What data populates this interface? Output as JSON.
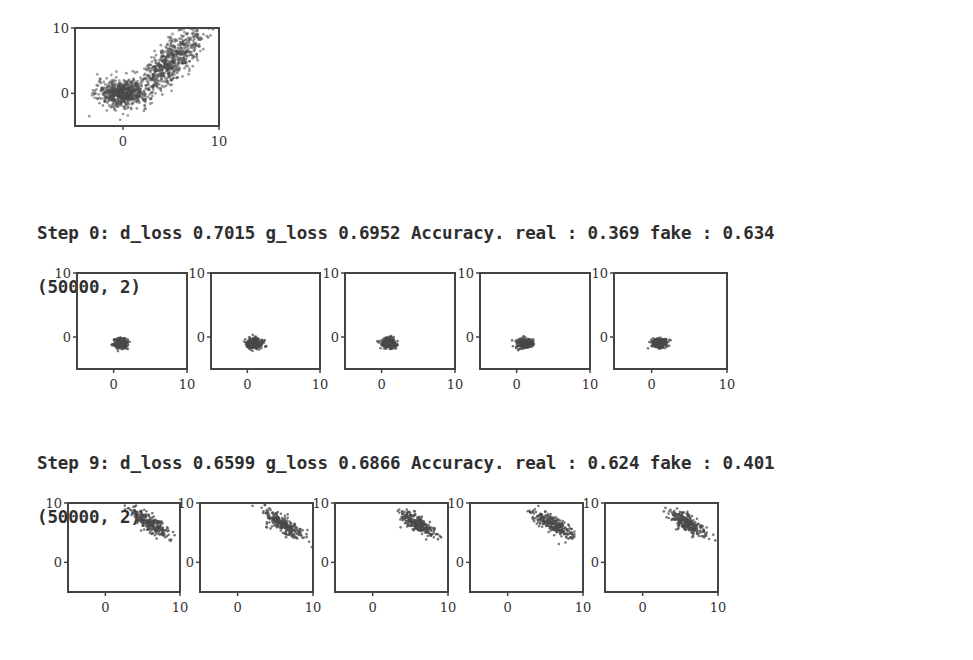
{
  "output": {
    "blocks": [
      {
        "step_line": "Step 0: d_loss 0.7015 g_loss 0.6952 Accuracy. real : 0.369 fake : 0.634",
        "shape_line": "(50000, 2)"
      },
      {
        "step_line": "Step 9: d_loss 0.6599 g_loss 0.6866 Accuracy. real : 0.624 fake : 0.401",
        "shape_line": "(50000, 2)"
      }
    ]
  },
  "chart_data": [
    {
      "type": "scatter",
      "title": "Real data distribution",
      "xlim": [
        -5,
        10
      ],
      "ylim": [
        -5,
        10
      ],
      "xticks": [
        "0",
        "10"
      ],
      "yticks": [
        "0",
        "10"
      ],
      "grid": false,
      "clusters": [
        {
          "name": "blob-1",
          "center": [
            0,
            0
          ],
          "spread": [
            1.3,
            1.0
          ],
          "angle": 0
        },
        {
          "name": "blob-2",
          "center": [
            5,
            5
          ],
          "spread": [
            0.9,
            3.0
          ],
          "angle": -30
        }
      ]
    },
    {
      "type": "scatter",
      "title": "Step 0 generated samples",
      "xlim": [
        -5,
        10
      ],
      "ylim": [
        -5,
        10
      ],
      "xticks": [
        "0",
        "10"
      ],
      "yticks": [
        "0",
        "10"
      ],
      "panels": [
        {
          "center": [
            1,
            -1
          ],
          "spread": [
            0.5,
            0.4
          ],
          "angle": 0
        },
        {
          "center": [
            1,
            -1
          ],
          "spread": [
            0.55,
            0.4
          ],
          "angle": 0
        },
        {
          "center": [
            1,
            -1
          ],
          "spread": [
            0.5,
            0.4
          ],
          "angle": 0
        },
        {
          "center": [
            1,
            -1
          ],
          "spread": [
            0.55,
            0.4
          ],
          "angle": 0
        },
        {
          "center": [
            1,
            -1
          ],
          "spread": [
            0.5,
            0.4
          ],
          "angle": 0
        }
      ]
    },
    {
      "type": "scatter",
      "title": "Step 9 generated samples",
      "xlim": [
        -5,
        10
      ],
      "ylim": [
        -5,
        10
      ],
      "xticks": [
        "0",
        "10"
      ],
      "yticks": [
        "0",
        "10"
      ],
      "panels": [
        {
          "center": [
            6,
            6.5
          ],
          "spread": [
            1.6,
            0.55
          ],
          "angle": -40
        },
        {
          "center": [
            6,
            6.5
          ],
          "spread": [
            1.6,
            0.55
          ],
          "angle": -40
        },
        {
          "center": [
            6,
            6.5
          ],
          "spread": [
            1.6,
            0.55
          ],
          "angle": -40
        },
        {
          "center": [
            6,
            6.5
          ],
          "spread": [
            1.6,
            0.55
          ],
          "angle": -40
        },
        {
          "center": [
            6,
            6.5
          ],
          "spread": [
            1.6,
            0.55
          ],
          "angle": -40
        }
      ]
    }
  ],
  "colors": {
    "points": "#4a4a4a",
    "axes": "#444444",
    "text": "#2e2e2e"
  }
}
